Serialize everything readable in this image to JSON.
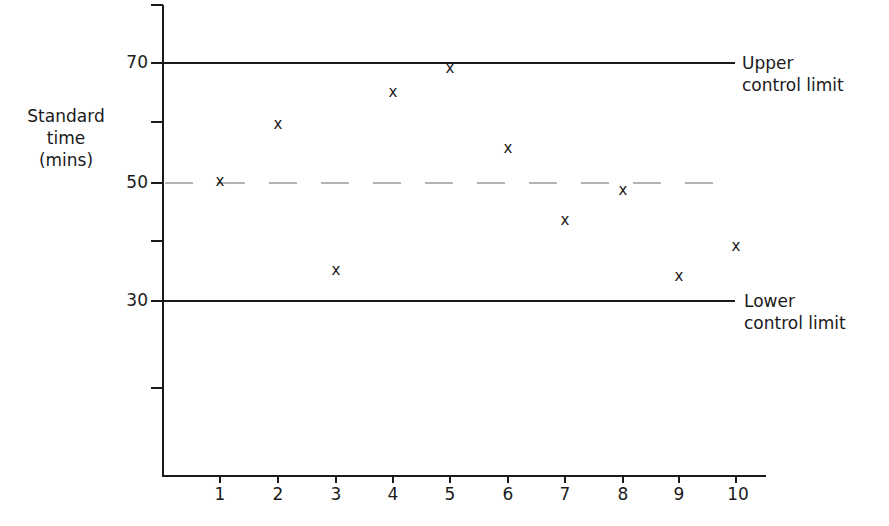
{
  "chart_data": {
    "type": "scatter",
    "title": "",
    "xlabel": "",
    "ylabel": "Standard time (mins)",
    "ylabel_lines": [
      "Standard",
      "time",
      "(mins)"
    ],
    "x": [
      1,
      2,
      3,
      4,
      5,
      6,
      7,
      8,
      9,
      10
    ],
    "values": [
      50,
      59.5,
      35,
      65,
      69,
      55.5,
      43.5,
      48.5,
      34,
      39
    ],
    "marker": "x",
    "x_tick_labels": [
      "1",
      "2",
      "3",
      "4",
      "5",
      "6",
      "7",
      "8",
      "9",
      "10"
    ],
    "y_tick_labels": [
      "70",
      "50",
      "30"
    ],
    "ylim": [
      15,
      80
    ],
    "grid": false,
    "reference_lines": [
      {
        "name": "Upper control limit",
        "value": 70,
        "style": "solid",
        "label_lines": [
          "Upper",
          "control limit"
        ]
      },
      {
        "name": "Mean",
        "value": 50,
        "style": "dashed"
      },
      {
        "name": "Lower control limit",
        "value": 30,
        "style": "solid",
        "label_lines": [
          "Lower",
          "control limit"
        ]
      }
    ]
  },
  "colors": {
    "axis": "#1a1a1a",
    "mean_line": "#9a9a9a",
    "marker": "#1a1a1a"
  }
}
